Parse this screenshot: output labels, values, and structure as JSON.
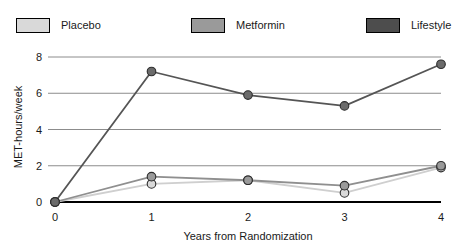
{
  "legend": {
    "position": "top",
    "entries": [
      {
        "label": "Placebo",
        "color": "#d9d9d9",
        "swatch_name": "legend-swatch-placebo"
      },
      {
        "label": "Metformin",
        "color": "#9a9a9a",
        "swatch_name": "legend-swatch-metformin"
      },
      {
        "label": "Lifestyle",
        "color": "#4d4d4d",
        "swatch_name": "legend-swatch-lifestyle"
      }
    ]
  },
  "axes": {
    "x_title": "Years from Randomization",
    "y_title": "MET-hours/week",
    "x_ticks": [
      "0",
      "1",
      "2",
      "3",
      "4"
    ],
    "y_ticks": [
      "0",
      "2",
      "4",
      "6",
      "8"
    ]
  },
  "chart_data": {
    "type": "line",
    "title": "",
    "subtitle": "",
    "xlabel": "Years from Randomization",
    "ylabel": "MET-hours/week",
    "x": [
      0,
      1,
      2,
      3,
      4
    ],
    "xlim": [
      0,
      4
    ],
    "ylim": [
      0,
      8
    ],
    "xticks": [
      0,
      1,
      2,
      3,
      4
    ],
    "yticks": [
      0,
      2,
      4,
      6,
      8
    ],
    "grid": "horizontal",
    "legend_position": "top",
    "marker": "circle",
    "series": [
      {
        "name": "Placebo",
        "color": "#d9d9d9",
        "line_color": "#cfcfcf",
        "values": [
          0,
          1.0,
          1.2,
          0.5,
          1.9
        ]
      },
      {
        "name": "Metformin",
        "color": "#9a9a9a",
        "line_color": "#8f8f8f",
        "values": [
          0,
          1.4,
          1.2,
          0.9,
          2.0
        ]
      },
      {
        "name": "Lifestyle",
        "color": "#6b6b6b",
        "line_color": "#555555",
        "values": [
          0,
          7.2,
          5.9,
          5.3,
          7.6
        ]
      }
    ]
  }
}
